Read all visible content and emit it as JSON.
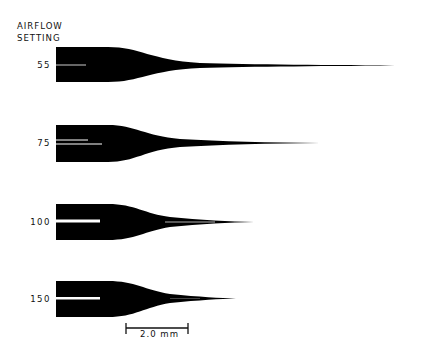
{
  "header": {
    "line1": "AIRFLOW",
    "line2": "SETTING"
  },
  "profiles": [
    {
      "setting": "55",
      "label": "55"
    },
    {
      "setting": "75",
      "label": "75"
    },
    {
      "setting": "100",
      "label": "100"
    },
    {
      "setting": "150",
      "label": "150"
    }
  ],
  "scale_bar": {
    "label": "2.0 mm"
  },
  "colors": {
    "shape": "#000000",
    "background": "#ffffff"
  }
}
